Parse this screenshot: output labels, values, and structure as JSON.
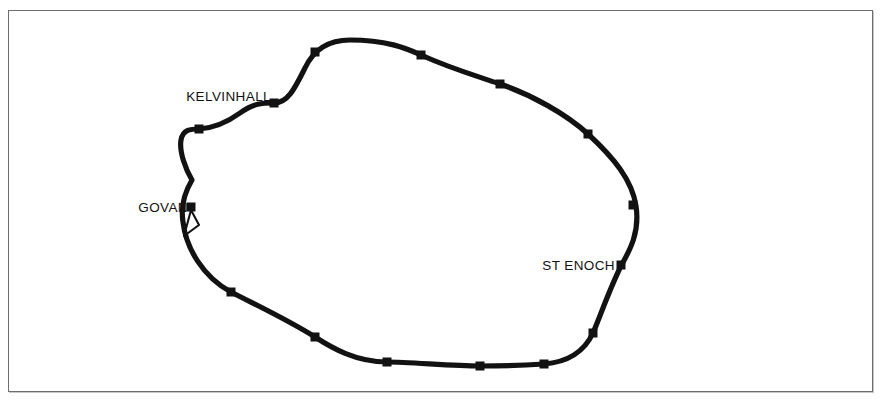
{
  "figure": {
    "background_color": "#ffffff",
    "frame": {
      "border_color": "#6d6d6d",
      "x": 8,
      "y": 10,
      "width": 865,
      "height": 382
    }
  },
  "route": {
    "name": "subway-loop",
    "color": "#121212",
    "stroke_width": 5.2,
    "closed": true,
    "path": "M 350 40 C 386 40 406 48 421 55 C 452 69 474 75 500 84 C 532 95 566 114 588 134 C 614 158 632 180 636 206 C 640 232 630 250 621 266 C 610 288 601 314 593 333 C 585 350 570 362 544 364 C 512 366 498 366 480 366 C 452 366 410 362 387 362 C 356 362 332 348 315 337 C 288 320 258 306 231 292 C 203 277 186 248 183 222 C 180 203 186 190 192 180 C 186 170 179 152 181 140 C 183 129 191 129 199 129 C 214 128 229 121 240 113 C 254 103 262 103 274 103 C 288 103 295 88 305 68 C 313 51 327 40 350 40 Z"
  },
  "branch": {
    "name": "govan-depot-stub",
    "color": "#121212",
    "stroke_width": 2.1,
    "path": "M 191 210 L 184 236 M 191 210 L 199 225 L 184 236"
  },
  "stations": [
    {
      "id": "st-top-left",
      "label": "",
      "x": 315,
      "y": 52,
      "labeled": false
    },
    {
      "id": "st-top-right",
      "label": "",
      "x": 421,
      "y": 55,
      "labeled": false
    },
    {
      "id": "st-east-upper",
      "label": "",
      "x": 500,
      "y": 84,
      "labeled": false
    },
    {
      "id": "st-east-mid",
      "label": "",
      "x": 588,
      "y": 134,
      "labeled": false
    },
    {
      "id": "st-east-lower",
      "label": "",
      "x": 633,
      "y": 205,
      "labeled": false
    },
    {
      "id": "st-enoch",
      "label": "ST ENOCH",
      "x": 621,
      "y": 265,
      "labeled": true,
      "label_x": 615,
      "label_y": 270,
      "label_anchor": "end"
    },
    {
      "id": "st-south-east",
      "label": "",
      "x": 593,
      "y": 333,
      "labeled": false
    },
    {
      "id": "st-south-mid-east",
      "label": "",
      "x": 544,
      "y": 364,
      "labeled": false
    },
    {
      "id": "st-south-mid",
      "label": "",
      "x": 480,
      "y": 366,
      "labeled": false
    },
    {
      "id": "st-south-mid-west",
      "label": "",
      "x": 387,
      "y": 362,
      "labeled": false
    },
    {
      "id": "st-south-west",
      "label": "",
      "x": 315,
      "y": 337,
      "labeled": false
    },
    {
      "id": "st-west-lower",
      "label": "",
      "x": 231,
      "y": 292,
      "labeled": false
    },
    {
      "id": "st-govan",
      "label": "GOVAN",
      "x": 191,
      "y": 207,
      "labeled": true,
      "label_x": 188,
      "label_y": 212,
      "label_anchor": "end"
    },
    {
      "id": "st-west-upper",
      "label": "",
      "x": 199,
      "y": 129,
      "labeled": false
    },
    {
      "id": "st-kelvinhall",
      "label": "KELVINHALL",
      "x": 274,
      "y": 103,
      "labeled": true,
      "label_x": 271,
      "label_y": 101,
      "label_anchor": "end"
    }
  ],
  "marker_style": {
    "shape": "square",
    "size": 9,
    "color": "#121212"
  }
}
